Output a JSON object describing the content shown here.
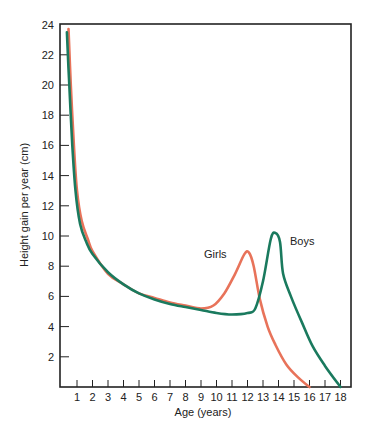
{
  "chart_data": {
    "type": "line",
    "title": "",
    "xlabel": "Age (years)",
    "ylabel": "Height gain per year (cm)",
    "xlim": [
      0,
      18.8
    ],
    "ylim": [
      0,
      24
    ],
    "x_ticks": [
      1,
      2,
      3,
      4,
      5,
      6,
      7,
      8,
      9,
      10,
      11,
      12,
      13,
      14,
      15,
      16,
      17,
      18
    ],
    "y_ticks": [
      2,
      4,
      6,
      8,
      10,
      12,
      14,
      16,
      18,
      20,
      22,
      24
    ],
    "grid": false,
    "legend": "inline labels near curve peaks",
    "series": [
      {
        "name": "Girls",
        "color": "#e8735a",
        "points": [
          [
            0.45,
            23.7
          ],
          [
            0.6,
            20.0
          ],
          [
            0.8,
            16.0
          ],
          [
            1.0,
            13.0
          ],
          [
            1.3,
            11.0
          ],
          [
            1.7,
            9.8
          ],
          [
            2.0,
            9.0
          ],
          [
            3.0,
            7.5
          ],
          [
            4.0,
            6.8
          ],
          [
            5.0,
            6.2
          ],
          [
            6.0,
            5.9
          ],
          [
            7.0,
            5.6
          ],
          [
            8.0,
            5.4
          ],
          [
            9.0,
            5.2
          ],
          [
            9.8,
            5.4
          ],
          [
            10.5,
            6.2
          ],
          [
            11.2,
            7.5
          ],
          [
            11.8,
            8.8
          ],
          [
            12.1,
            8.9
          ],
          [
            12.4,
            8.0
          ],
          [
            12.8,
            5.8
          ],
          [
            13.3,
            4.0
          ],
          [
            13.8,
            2.8
          ],
          [
            14.5,
            1.5
          ],
          [
            15.3,
            0.6
          ],
          [
            16.0,
            0.0
          ]
        ]
      },
      {
        "name": "Boys",
        "color": "#1a7a5e",
        "points": [
          [
            0.35,
            23.5
          ],
          [
            0.5,
            20.0
          ],
          [
            0.7,
            16.0
          ],
          [
            0.9,
            13.0
          ],
          [
            1.2,
            10.8
          ],
          [
            1.6,
            9.6
          ],
          [
            2.0,
            8.8
          ],
          [
            3.0,
            7.6
          ],
          [
            4.0,
            6.8
          ],
          [
            5.0,
            6.2
          ],
          [
            6.0,
            5.8
          ],
          [
            7.0,
            5.5
          ],
          [
            8.0,
            5.3
          ],
          [
            9.0,
            5.1
          ],
          [
            10.0,
            4.9
          ],
          [
            11.0,
            4.8
          ],
          [
            12.0,
            4.9
          ],
          [
            12.5,
            5.2
          ],
          [
            13.0,
            7.0
          ],
          [
            13.5,
            9.8
          ],
          [
            13.8,
            10.2
          ],
          [
            14.1,
            9.6
          ],
          [
            14.3,
            7.5
          ],
          [
            14.8,
            6.0
          ],
          [
            15.5,
            4.3
          ],
          [
            16.2,
            2.7
          ],
          [
            17.0,
            1.4
          ],
          [
            18.0,
            0.0
          ]
        ]
      }
    ],
    "annotations": [
      {
        "text": "Girls",
        "x": 9.6,
        "y": 8.6
      },
      {
        "text": "Boys",
        "x": 14.6,
        "y": 9.5
      }
    ]
  },
  "labels": {
    "xlabel": "Age (years)",
    "ylabel": "Height gain per year (cm)",
    "girls": "Girls",
    "boys": "Boys"
  }
}
